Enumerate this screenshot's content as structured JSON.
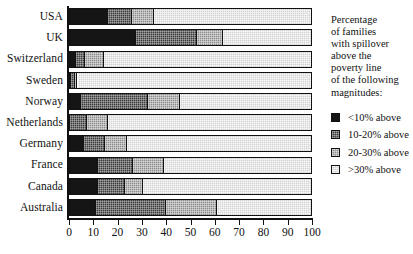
{
  "chart_data": {
    "type": "bar",
    "orientation": "horizontal",
    "stacked": true,
    "title": "",
    "xlabel": "",
    "ylabel": "",
    "xlim": [
      0,
      100
    ],
    "xticks": [
      0,
      10,
      20,
      30,
      40,
      50,
      60,
      70,
      80,
      90,
      100
    ],
    "xtick_labels": [
      "0",
      "10",
      "20",
      "30",
      "40",
      "50",
      "60",
      "70",
      "80",
      "90",
      "100"
    ],
    "grid": false,
    "legend_position": "right",
    "categories": [
      "USA",
      "UK",
      "Switzerland",
      "Sweden",
      "Norway",
      "Netherlands",
      "Germany",
      "France",
      "Canada",
      "Australia"
    ],
    "series": [
      {
        "name": "<10% above",
        "color": "#151515",
        "values": [
          16,
          27.5,
          3,
          1,
          5,
          0.5,
          6,
          12,
          12,
          11
        ]
      },
      {
        "name": "10-20% above",
        "color": "#3d3d3d",
        "values": [
          10,
          25,
          3.5,
          1.5,
          27.5,
          7,
          9,
          14.5,
          11,
          29
        ]
      },
      {
        "name": "20-30% above",
        "color": "#8d8d8d",
        "values": [
          9,
          11,
          8,
          1,
          13,
          8.5,
          9,
          12.5,
          7.5,
          21
        ]
      },
      {
        "name": ">30% above",
        "color": "#d2d2d2",
        "values": [
          65,
          36.5,
          85.5,
          96.5,
          54.5,
          84,
          76,
          61,
          69.5,
          39
        ]
      }
    ]
  },
  "legend": {
    "title_lines": [
      "Percentage",
      "of families",
      "with spillover",
      "above the",
      "poverty line",
      "of the following",
      "magnitudes:"
    ],
    "items": [
      {
        "label": "<10% above"
      },
      {
        "label": "10-20% above"
      },
      {
        "label": "20-30% above"
      },
      {
        "label": ">30% above"
      }
    ]
  }
}
